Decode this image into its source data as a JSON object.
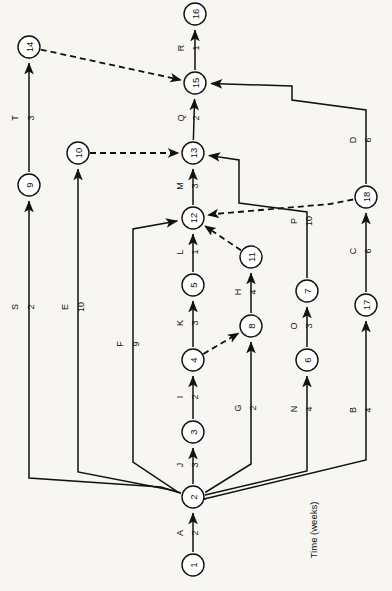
{
  "diagram": {
    "title_note": "Time (weeks)",
    "orientation": "rotated-90",
    "line_color": "#111111",
    "node_fill": "#ffffff",
    "background": "#f7f6f3"
  },
  "nodes": [
    {
      "id": "1",
      "label": "1",
      "x": 193,
      "y": 565,
      "r": 11
    },
    {
      "id": "2",
      "label": "2",
      "x": 193,
      "y": 497,
      "r": 11
    },
    {
      "id": "3",
      "label": "3",
      "x": 193,
      "y": 432,
      "r": 11
    },
    {
      "id": "4",
      "label": "4",
      "x": 193,
      "y": 360,
      "r": 11
    },
    {
      "id": "5",
      "label": "5",
      "x": 193,
      "y": 285,
      "r": 11
    },
    {
      "id": "6",
      "label": "6",
      "x": 307,
      "y": 360,
      "r": 11
    },
    {
      "id": "7",
      "label": "7",
      "x": 307,
      "y": 291,
      "r": 11
    },
    {
      "id": "8",
      "label": "8",
      "x": 251,
      "y": 326,
      "r": 11
    },
    {
      "id": "9",
      "label": "9",
      "x": 29,
      "y": 185,
      "r": 11
    },
    {
      "id": "10",
      "label": "10",
      "x": 78,
      "y": 153,
      "r": 11
    },
    {
      "id": "11",
      "label": "11",
      "x": 251,
      "y": 257,
      "r": 11
    },
    {
      "id": "12",
      "label": "12",
      "x": 193,
      "y": 218,
      "r": 11
    },
    {
      "id": "13",
      "label": "13",
      "x": 193,
      "y": 153,
      "r": 11
    },
    {
      "id": "14",
      "label": "14",
      "x": 29,
      "y": 47,
      "r": 11
    },
    {
      "id": "15",
      "label": "15",
      "x": 195,
      "y": 83,
      "r": 11
    },
    {
      "id": "16",
      "label": "16",
      "x": 195,
      "y": 14,
      "r": 11
    },
    {
      "id": "17",
      "label": "17",
      "x": 366,
      "y": 305,
      "r": 11
    },
    {
      "id": "18",
      "label": "18",
      "x": 366,
      "y": 197,
      "r": 11
    }
  ],
  "activities": [
    {
      "name": "A",
      "duration": "2",
      "from": "1",
      "to": "2",
      "dashed": false,
      "label_x": 180,
      "label_y": 533,
      "dur_x": 195,
      "dur_y": 533
    },
    {
      "name": "B",
      "duration": "4",
      "from": "2",
      "to": "17",
      "dashed": false,
      "label_x": 353,
      "label_y": 410,
      "dur_x": 368,
      "dur_y": 410
    },
    {
      "name": "C",
      "duration": "6",
      "from": "17",
      "to": "18",
      "dashed": false,
      "label_x": 353,
      "label_y": 251,
      "dur_x": 368,
      "dur_y": 251
    },
    {
      "name": "D",
      "duration": "6",
      "from": "18",
      "to": "15",
      "dashed": false,
      "label_x": 353,
      "label_y": 140,
      "dur_x": 368,
      "dur_y": 140
    },
    {
      "name": "E",
      "duration": "10",
      "from": "2",
      "to": "10",
      "dashed": false,
      "label_x": 65,
      "label_y": 307,
      "dur_x": 81,
      "dur_y": 307
    },
    {
      "name": "F",
      "duration": "9",
      "from": "2",
      "to": "12",
      "dashed": false,
      "label_x": 120,
      "label_y": 344,
      "dur_x": 136,
      "dur_y": 344
    },
    {
      "name": "G",
      "duration": "2",
      "from": "2",
      "to": "8",
      "dashed": false,
      "label_x": 238,
      "label_y": 408,
      "dur_x": 253,
      "dur_y": 408
    },
    {
      "name": "H",
      "duration": "4",
      "from": "8",
      "to": "11",
      "dashed": false,
      "label_x": 238,
      "label_y": 292,
      "dur_x": 253,
      "dur_y": 292
    },
    {
      "name": "I",
      "duration": "2",
      "from": "3",
      "to": "4",
      "dashed": false,
      "label_x": 180,
      "label_y": 397,
      "dur_x": 195,
      "dur_y": 397
    },
    {
      "name": "J",
      "duration": "3",
      "from": "2",
      "to": "3",
      "dashed": false,
      "label_x": 180,
      "label_y": 465,
      "dur_x": 195,
      "dur_y": 465
    },
    {
      "name": "K",
      "duration": "3",
      "from": "4",
      "to": "5",
      "dashed": false,
      "label_x": 180,
      "label_y": 323,
      "dur_x": 195,
      "dur_y": 323
    },
    {
      "name": "L",
      "duration": "1",
      "from": "5",
      "to": "12",
      "dashed": false,
      "label_x": 180,
      "label_y": 252,
      "dur_x": 195,
      "dur_y": 252
    },
    {
      "name": "M",
      "duration": "3",
      "from": "12",
      "to": "13",
      "dashed": false,
      "label_x": 180,
      "label_y": 186,
      "dur_x": 195,
      "dur_y": 186
    },
    {
      "name": "N",
      "duration": "4",
      "from": "2",
      "to": "6",
      "dashed": false,
      "label_x": 294,
      "label_y": 409,
      "dur_x": 309,
      "dur_y": 409
    },
    {
      "name": "O",
      "duration": "3",
      "from": "6",
      "to": "7",
      "dashed": false,
      "label_x": 294,
      "label_y": 326,
      "dur_x": 309,
      "dur_y": 326
    },
    {
      "name": "P",
      "duration": "10",
      "from": "7",
      "to": "13",
      "dashed": false,
      "label_x": 294,
      "label_y": 221,
      "dur_x": 309,
      "dur_y": 221
    },
    {
      "name": "Q",
      "duration": "2",
      "from": "13",
      "to": "15",
      "dashed": false,
      "label_x": 181,
      "label_y": 118,
      "dur_x": 196,
      "dur_y": 118
    },
    {
      "name": "R",
      "duration": "1",
      "from": "15",
      "to": "16",
      "dashed": false,
      "label_x": 181,
      "label_y": 48,
      "dur_x": 196,
      "dur_y": 48
    },
    {
      "name": "S",
      "duration": "2",
      "from": "2",
      "to": "9",
      "dashed": false,
      "label_x": 15,
      "label_y": 307,
      "dur_x": 31,
      "dur_y": 307
    },
    {
      "name": "T",
      "duration": "3",
      "from": "9",
      "to": "14",
      "dashed": false,
      "label_x": 15,
      "label_y": 118,
      "dur_x": 31,
      "dur_y": 118
    }
  ],
  "dummy_activities": [
    {
      "from": "14",
      "to": "15",
      "dashed": true
    },
    {
      "from": "10",
      "to": "13",
      "dashed": true
    },
    {
      "from": "18",
      "to": "12",
      "dashed": true
    },
    {
      "from": "11",
      "to": "12",
      "dashed": true
    },
    {
      "from": "4",
      "to": "8",
      "dashed": true
    }
  ],
  "footer": {
    "time_unit_label": "Time (weeks)",
    "time_label_x": 313,
    "time_label_y": 530
  }
}
